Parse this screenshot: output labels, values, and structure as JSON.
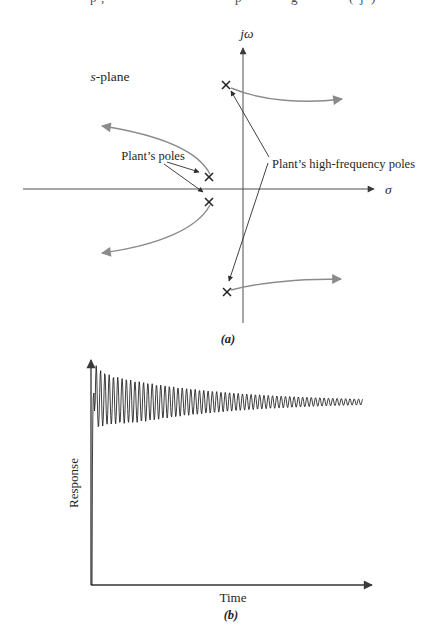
{
  "figure": {
    "cropped_top_line": {
      "fragments": [
        {
          "left": 90,
          "ch": "p"
        },
        {
          "left": 101,
          "ch": ","
        },
        {
          "left": 235,
          "ch": "p"
        },
        {
          "left": 291,
          "ch": "g"
        },
        {
          "left": 349,
          "ch": "("
        },
        {
          "left": 360,
          "ch": "j"
        },
        {
          "left": 371,
          "ch": ")"
        }
      ]
    }
  },
  "splane": {
    "plane_label_italic": "s",
    "plane_label_rest": "-plane",
    "imag_axis_label": "jω",
    "real_axis_label": "σ",
    "plant_poles_label": "Plant’s poles",
    "hf_poles_label": "Plant’s high-frequency poles",
    "caption": "(a)"
  },
  "response_plot": {
    "ylabel": "Response",
    "xlabel": "Time",
    "caption": "(b)"
  },
  "chart_data": [
    {
      "type": "scatter",
      "title": "s-plane root-locus sketch",
      "units": "figure px (no numeric scale shown)",
      "axes": {
        "imag_axis_x": 243,
        "real_axis_y": 189,
        "imag_label": "jω",
        "real_label": "σ"
      },
      "poles": [
        {
          "name": "plant-pole-upper",
          "x": 209,
          "y": 177
        },
        {
          "name": "plant-pole-lower",
          "x": 209,
          "y": 202
        },
        {
          "name": "high-frequency-pole-upper",
          "x": 226,
          "y": 85
        },
        {
          "name": "high-frequency-pole-lower",
          "x": 227,
          "y": 292
        }
      ],
      "locus_branches": [
        {
          "from": "plant-pole-upper",
          "direction": "up-left",
          "arrow_end": [
            100,
            126
          ]
        },
        {
          "from": "plant-pole-lower",
          "direction": "down-left",
          "arrow_end": [
            100,
            253
          ]
        },
        {
          "from": "high-frequency-pole-upper",
          "direction": "right",
          "arrow_end": [
            344,
            99
          ]
        },
        {
          "from": "high-frequency-pole-lower",
          "direction": "right",
          "arrow_end": [
            343,
            279
          ]
        }
      ]
    },
    {
      "type": "line",
      "title": "Response vs Time",
      "xlabel": "Time",
      "ylabel": "Response",
      "description": "qualitative sketch: fast initial rise, then lightly damped high-frequency oscillation whose envelope decays slowly toward a steady value",
      "osc": {
        "x0": 95.2,
        "x1": 363,
        "baseline_y": 402,
        "period": 4.3,
        "amp_slow": 30,
        "tau_slow": 115,
        "amp_fast": 8,
        "tau_fast": 6,
        "min_amp": 2.8,
        "lead_in": [
          [
            92,
            585
          ],
          [
            92.4,
            468
          ],
          [
            92.8,
            420
          ],
          [
            93.2,
            398
          ],
          [
            93.9,
            393
          ],
          [
            94.5,
            411
          ],
          [
            95.2,
            402
          ]
        ]
      }
    }
  ]
}
